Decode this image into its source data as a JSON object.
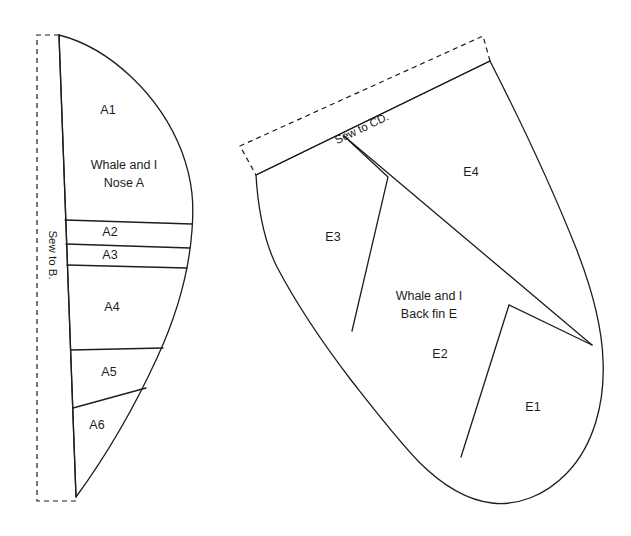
{
  "document": {
    "type": "sewing-pattern-sheet",
    "background_color": "#ffffff",
    "ink_color": "#1d1d1b"
  },
  "pieces": [
    {
      "id": "A",
      "title_line1": "Whale and I",
      "title_line2": "Nose A",
      "seam_note": "Sew to B.",
      "panels": [
        {
          "label": "A1"
        },
        {
          "label": "A2"
        },
        {
          "label": "A3"
        },
        {
          "label": "A4"
        },
        {
          "label": "A5"
        },
        {
          "label": "A6"
        }
      ]
    },
    {
      "id": "E",
      "title_line1": "Whale and I",
      "title_line2": "Back fin E",
      "seam_note": "Sew to CD.",
      "panels": [
        {
          "label": "E1"
        },
        {
          "label": "E2"
        },
        {
          "label": "E3"
        },
        {
          "label": "E4"
        }
      ]
    }
  ],
  "labels": {
    "a1": "A1",
    "a2": "A2",
    "a3": "A3",
    "a4": "A4",
    "a5": "A5",
    "a6": "A6",
    "e1": "E1",
    "e2": "E2",
    "e3": "E3",
    "e4": "E4",
    "nose_title_1": "Whale and I",
    "nose_title_2": "Nose A",
    "backfin_title_1": "Whale and I",
    "backfin_title_2": "Back fin E",
    "sew_to_b": "Sew to B.",
    "sew_to_cd": "Sew to CD."
  }
}
